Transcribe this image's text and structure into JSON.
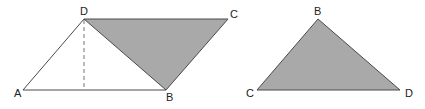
{
  "colors": {
    "stroke": "#4a4a4a",
    "fill": "#a9a9a9",
    "background": "#ffffff",
    "label": "#222222"
  },
  "figure_left": {
    "description": "Parallelogram ABCD with diagonal DB; triangle DBC shaded; dashed altitude from D to AB",
    "vertices": {
      "A": {
        "label": "A",
        "x": 23,
        "y": 90
      },
      "B": {
        "label": "B",
        "x": 166,
        "y": 90
      },
      "C": {
        "label": "C",
        "x": 228,
        "y": 19
      },
      "D": {
        "label": "D",
        "x": 84,
        "y": 19
      }
    },
    "shaded_triangle": [
      "D",
      "B",
      "C"
    ],
    "altitude": {
      "from": "D",
      "foot_x": 84,
      "foot_y": 90,
      "style": "dashed"
    }
  },
  "figure_right": {
    "description": "Shaded triangle BCD (triangle moved from parallelogram)",
    "vertices": {
      "B": {
        "label": "B",
        "x": 318,
        "y": 19
      },
      "C": {
        "label": "C",
        "x": 257,
        "y": 90
      },
      "D": {
        "label": "D",
        "x": 400,
        "y": 90
      }
    }
  }
}
